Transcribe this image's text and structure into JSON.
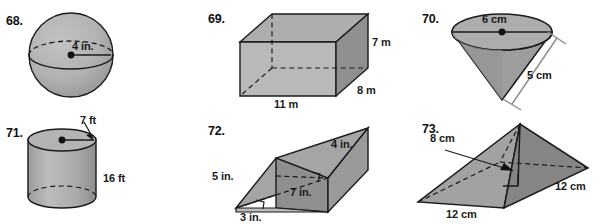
{
  "page": {
    "background": "#ffffff",
    "kind": "geometry-exercise-figures",
    "palette": {
      "face_light": "#b9b9b9",
      "face_medium": "#a8a8a8",
      "face_dark": "#8f8f8f",
      "face_darker": "#7e7e7e",
      "outline": "#1b1b1b",
      "dashed": "#1b1b1b",
      "text": "#111111",
      "bracket": "#8a8a8a"
    }
  },
  "problems": [
    {
      "number": "68.",
      "solid": "sphere",
      "labels": [
        {
          "text": "4 in.",
          "meaning": "radius"
        }
      ]
    },
    {
      "number": "69.",
      "solid": "rectangular-prism",
      "labels": [
        {
          "text": "7 m",
          "meaning": "height"
        },
        {
          "text": "8 m",
          "meaning": "depth"
        },
        {
          "text": "11 m",
          "meaning": "width"
        }
      ]
    },
    {
      "number": "70.",
      "solid": "inverted-cone",
      "labels": [
        {
          "text": "6 cm",
          "meaning": "diameter"
        },
        {
          "text": "5 cm",
          "meaning": "slant-height"
        }
      ]
    },
    {
      "number": "71.",
      "solid": "cylinder",
      "labels": [
        {
          "text": "7 ft",
          "meaning": "radius"
        },
        {
          "text": "16 ft",
          "meaning": "height"
        }
      ]
    },
    {
      "number": "72.",
      "solid": "triangular-prism",
      "labels": [
        {
          "text": "4 in.",
          "meaning": "triangle-leg-vertical"
        },
        {
          "text": "5 in.",
          "meaning": "triangle-hypotenuse"
        },
        {
          "text": "7 in.",
          "meaning": "prism-length"
        },
        {
          "text": "3 in.",
          "meaning": "triangle-leg-base"
        }
      ]
    },
    {
      "number": "73.",
      "solid": "square-pyramid",
      "labels": [
        {
          "text": "8 cm",
          "meaning": "height"
        },
        {
          "text": "12 cm",
          "meaning": "base-side-right"
        },
        {
          "text": "12 cm",
          "meaning": "base-side-front"
        }
      ]
    }
  ]
}
